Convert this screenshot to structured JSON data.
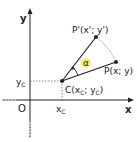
{
  "diagram": {
    "axes": {
      "x_label": "x",
      "y_label": "y",
      "origin_label": "O"
    },
    "points": {
      "C": {
        "label": "C(x",
        "sub1": "C",
        "mid": "; y",
        "sub2": "C",
        "end": ")"
      },
      "P": {
        "label": "P(x; y)"
      },
      "P_prime": {
        "label": "P'(x'; y')"
      }
    },
    "ticks": {
      "xc": "x",
      "xc_sub": "C",
      "yc": "y",
      "yc_sub": "C"
    },
    "angle": {
      "label": "α",
      "highlight_color": "#f5ee6a"
    },
    "colors": {
      "line": "#222222",
      "arc": "#bbbbbb",
      "dotted": "#555555"
    }
  }
}
